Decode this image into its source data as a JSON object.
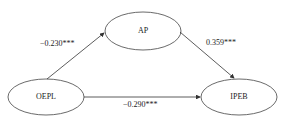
{
  "diagram": {
    "nodes": [
      {
        "id": "OEPL",
        "label": "OEPL"
      },
      {
        "id": "AP",
        "label": "AP"
      },
      {
        "id": "IPEB",
        "label": "IPEB"
      }
    ],
    "edges": [
      {
        "from": "OEPL",
        "to": "AP",
        "label": "−0.230***"
      },
      {
        "from": "AP",
        "to": "IPEB",
        "label": "0.359***"
      },
      {
        "from": "OEPL",
        "to": "IPEB",
        "label": "−0.290***"
      }
    ],
    "colors": {
      "stroke": "#333333",
      "text": "#222222",
      "background": "#ffffff"
    }
  }
}
